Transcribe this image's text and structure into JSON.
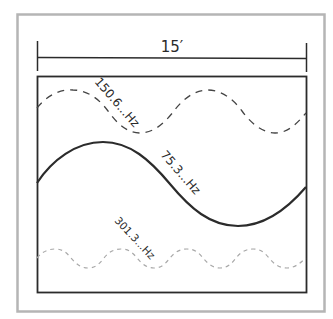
{
  "diagram": {
    "type": "room-mode standing waves",
    "dimension": {
      "label": "15′"
    },
    "waves": [
      {
        "id": "fundamental",
        "label": "75.3...Hz",
        "style": "solid",
        "color": "#2b2b2b"
      },
      {
        "id": "second-harmonic",
        "label": "150.6...Hz",
        "style": "dashed",
        "color": "#444444"
      },
      {
        "id": "fourth-harmonic",
        "label": "301.3...Hz",
        "style": "dotted-dashed-light",
        "color": "#a8a8a8"
      }
    ],
    "colors": {
      "outer_frame": "#b5b5b5",
      "room_box": "#2b2b2b",
      "background": "#ffffff"
    }
  }
}
